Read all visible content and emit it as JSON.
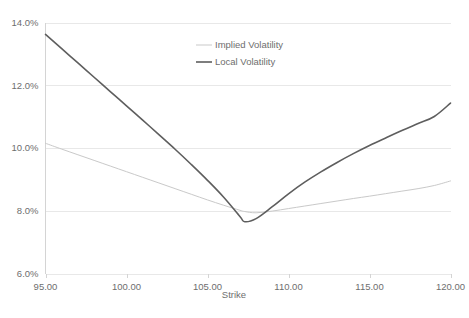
{
  "chart_data": {
    "type": "line",
    "title": "",
    "xlabel": "Strike",
    "ylabel": "",
    "xlim": [
      95,
      120
    ],
    "ylim": [
      0.06,
      0.14
    ],
    "xticks": [
      95,
      100,
      105,
      110,
      115,
      120
    ],
    "xtick_labels": [
      "95.00",
      "100.00",
      "105.00",
      "110.00",
      "115.00",
      "120.00"
    ],
    "yticks": [
      0.06,
      0.08,
      0.1,
      0.12,
      0.14
    ],
    "ytick_labels": [
      "6.0%",
      "8.0%",
      "10.0%",
      "12.0%",
      "14.0%"
    ],
    "grid": "horizontal",
    "legend_position": "top-center-right",
    "x": [
      95,
      96,
      97,
      98,
      99,
      100,
      101,
      102,
      103,
      104,
      105,
      106,
      107,
      107.3,
      108,
      109,
      110,
      111,
      112,
      113,
      114,
      115,
      116,
      117,
      118,
      119,
      120
    ],
    "series": [
      {
        "name": "Implied Volatility",
        "color": "#c9c9c9",
        "width": 1.0,
        "values": [
          0.1015,
          0.09965,
          0.09785,
          0.09605,
          0.09425,
          0.09245,
          0.09065,
          0.08885,
          0.08705,
          0.08525,
          0.08345,
          0.08175,
          0.08015,
          0.07975,
          0.07935,
          0.0799,
          0.0807,
          0.0815,
          0.0823,
          0.0831,
          0.0839,
          0.08465,
          0.08545,
          0.08625,
          0.08705,
          0.08805,
          0.0895
        ]
      },
      {
        "name": "Local Volatility",
        "color": "#5e5e5e",
        "width": 1.6,
        "values": [
          0.1362,
          0.13165,
          0.1271,
          0.12255,
          0.118,
          0.11345,
          0.1089,
          0.10425,
          0.0996,
          0.09475,
          0.0897,
          0.0843,
          0.0782,
          0.0765,
          0.0775,
          0.0813,
          0.0854,
          0.0891,
          0.0924,
          0.0954,
          0.0982,
          0.1008,
          0.1032,
          0.10555,
          0.1078,
          0.11005,
          0.1143
        ]
      }
    ]
  },
  "legend": {
    "entries": [
      {
        "label": "Implied Volatility"
      },
      {
        "label": "Local Volatility"
      }
    ]
  },
  "axes": {
    "x_title": "Strike"
  }
}
